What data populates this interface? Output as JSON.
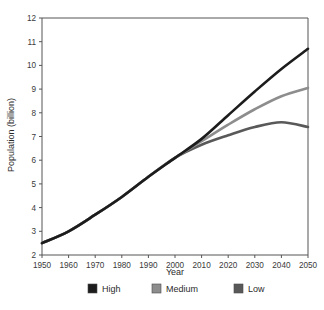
{
  "chart_data": {
    "type": "line",
    "title": "",
    "xlabel": "Year",
    "ylabel": "Population (billion)",
    "xlim": [
      1950,
      2050
    ],
    "ylim": [
      2,
      12
    ],
    "grid": false,
    "legend_position": "bottom",
    "xticks": [
      1950,
      1960,
      1970,
      1980,
      1990,
      2000,
      2010,
      2020,
      2030,
      2040,
      2050
    ],
    "yticks": [
      2,
      3,
      4,
      5,
      6,
      7,
      8,
      9,
      10,
      11,
      12
    ],
    "x": [
      1950,
      1960,
      1970,
      1980,
      1990,
      2000,
      2010,
      2020,
      2030,
      2040,
      2050
    ],
    "series": [
      {
        "name": "High",
        "color": "#1c1c1c",
        "values": [
          2.5,
          3.0,
          3.7,
          4.45,
          5.3,
          6.1,
          6.9,
          7.9,
          8.9,
          9.85,
          10.7
        ]
      },
      {
        "name": "Medium",
        "color": "#8d8d8d",
        "values": [
          2.5,
          3.0,
          3.7,
          4.45,
          5.3,
          6.1,
          6.8,
          7.5,
          8.15,
          8.7,
          9.05
        ]
      },
      {
        "name": "Low",
        "color": "#595959",
        "values": [
          2.5,
          3.0,
          3.7,
          4.45,
          5.3,
          6.1,
          6.65,
          7.05,
          7.4,
          7.6,
          7.4
        ]
      }
    ]
  },
  "legend": {
    "items": [
      {
        "label": "High",
        "color": "#1c1c1c"
      },
      {
        "label": "Medium",
        "color": "#8d8d8d"
      },
      {
        "label": "Low",
        "color": "#595959"
      }
    ]
  }
}
